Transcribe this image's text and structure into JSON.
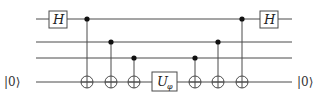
{
  "diagram": {
    "type": "quantum-circuit",
    "wires": [
      {
        "index": 0,
        "y": 19,
        "x_start": 36,
        "x_end": 292,
        "left_label": "",
        "right_label": ""
      },
      {
        "index": 1,
        "y": 42,
        "x_start": 36,
        "x_end": 292,
        "left_label": "",
        "right_label": ""
      },
      {
        "index": 2,
        "y": 58,
        "x_start": 36,
        "x_end": 292,
        "left_label": "",
        "right_label": ""
      },
      {
        "index": 3,
        "y": 82,
        "x_start": 36,
        "x_end": 292,
        "left_label": "|0⟩",
        "right_label": "|0⟩"
      }
    ],
    "gates": [
      {
        "type": "box",
        "label": "H",
        "wire": 0,
        "x": 58
      },
      {
        "type": "cnot",
        "control_wire": 0,
        "target_wire": 3,
        "x": 87
      },
      {
        "type": "cnot",
        "control_wire": 1,
        "target_wire": 3,
        "x": 111
      },
      {
        "type": "cnot",
        "control_wire": 2,
        "target_wire": 3,
        "x": 134
      },
      {
        "type": "box",
        "label": "U",
        "subscript": "φ",
        "wire": 3,
        "x": 164
      },
      {
        "type": "cnot",
        "control_wire": 2,
        "target_wire": 3,
        "x": 195
      },
      {
        "type": "cnot",
        "control_wire": 1,
        "target_wire": 3,
        "x": 218
      },
      {
        "type": "cnot",
        "control_wire": 0,
        "target_wire": 3,
        "x": 242
      },
      {
        "type": "box",
        "label": "H",
        "wire": 0,
        "x": 269
      }
    ],
    "labels": {
      "h_left": "H",
      "h_right": "H",
      "u_main": "U",
      "u_sub": "φ",
      "input_ket": "|0⟩",
      "output_ket": "|0⟩"
    },
    "colors": {
      "wire": "#4a4a4a",
      "control_dot": "#111111",
      "background": "#ffffff"
    }
  }
}
